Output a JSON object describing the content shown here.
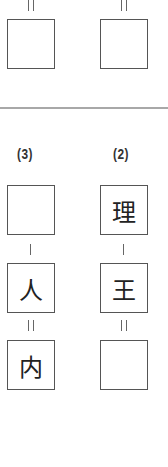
{
  "top_section": {
    "left": {
      "operator": "=",
      "box": ""
    },
    "right": {
      "operator": "=",
      "box": ""
    }
  },
  "problems": [
    {
      "number": "(3)",
      "boxes": [
        "",
        "人",
        "内"
      ],
      "operators": [
        "-",
        "="
      ]
    },
    {
      "number": "(2)",
      "boxes": [
        "理",
        "王",
        ""
      ],
      "operators": [
        "-",
        "="
      ]
    }
  ],
  "colors": {
    "border": "#555555",
    "divider": "#a8a8a8",
    "text": "#222222"
  }
}
